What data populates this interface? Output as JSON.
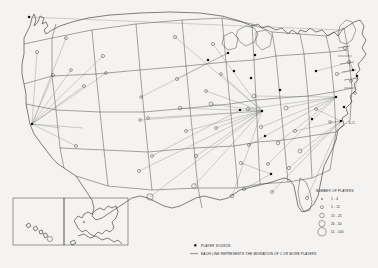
{
  "map": {
    "title": "Player Migration Map of the United States",
    "region_label": "United States",
    "annotations": [
      {
        "name": "dc-label",
        "text": "D.C.",
        "x": 347,
        "y": 122
      }
    ]
  },
  "size_legend": {
    "title": "NUMBER OF PLAYERS",
    "classes": [
      {
        "label": "1 - 4",
        "radius": 0.7
      },
      {
        "label": "5 - 12",
        "radius": 1.5
      },
      {
        "label": "13 - 25",
        "radius": 2.3
      },
      {
        "label": "26 - 50",
        "radius": 3.1
      },
      {
        "label": "51 - 100",
        "radius": 4.1
      }
    ]
  },
  "symbol_legend": {
    "items": [
      {
        "symbol": "filled-square",
        "label": "PLAYER SOURCE"
      },
      {
        "symbol": "line",
        "label": "EACH LINE REPRESENTS THE MIGRATION OF 1 OR MORE PLAYERS"
      }
    ]
  },
  "insets": [
    {
      "name": "hawaii",
      "label": ""
    },
    {
      "name": "alaska",
      "label": ""
    }
  ],
  "colors": {
    "background": "#f4f3f1",
    "outline": "#3b3b3b",
    "coast": "#2e2e2e",
    "flow_line": "#7d7d7d",
    "source_marker": "#111111",
    "text": "#222222"
  },
  "chart_data": {
    "type": "scatter",
    "xlabel": "",
    "ylabel": "",
    "size_classes": [
      "1 - 4",
      "5 - 12",
      "13 - 25",
      "26 - 50",
      "51 - 100"
    ],
    "bubbles": [
      {
        "x": 37,
        "y": 52,
        "r": 1.6,
        "class": "5 - 12"
      },
      {
        "x": 66,
        "y": 38,
        "r": 1.5,
        "class": "5 - 12"
      },
      {
        "x": 53,
        "y": 75,
        "r": 1.6,
        "class": "5 - 12"
      },
      {
        "x": 71,
        "y": 70,
        "r": 1.4,
        "class": "5 - 12"
      },
      {
        "x": 84,
        "y": 86,
        "r": 1.5,
        "class": "5 - 12"
      },
      {
        "x": 76,
        "y": 146,
        "r": 1.5,
        "class": "5 - 12"
      },
      {
        "x": 103,
        "y": 56,
        "r": 1.6,
        "class": "5 - 12"
      },
      {
        "x": 106,
        "y": 73,
        "r": 1.4,
        "class": "5 - 12"
      },
      {
        "x": 139,
        "y": 171,
        "r": 1.6,
        "class": "5 - 12"
      },
      {
        "x": 140,
        "y": 120,
        "r": 1.4,
        "class": "5 - 12"
      },
      {
        "x": 141,
        "y": 97,
        "r": 1.3,
        "class": "1 - 4"
      },
      {
        "x": 148,
        "y": 118,
        "r": 1.4,
        "class": "5 - 12"
      },
      {
        "x": 150,
        "y": 197,
        "r": 3.2,
        "class": "26 - 50"
      },
      {
        "x": 152,
        "y": 156,
        "r": 1.5,
        "class": "5 - 12"
      },
      {
        "x": 175,
        "y": 37,
        "r": 1.6,
        "class": "5 - 12"
      },
      {
        "x": 177,
        "y": 79,
        "r": 1.6,
        "class": "5 - 12"
      },
      {
        "x": 180,
        "y": 108,
        "r": 1.8,
        "class": "13 - 25"
      },
      {
        "x": 186,
        "y": 131,
        "r": 1.5,
        "class": "5 - 12"
      },
      {
        "x": 194,
        "y": 186,
        "r": 2.4,
        "class": "13 - 25"
      },
      {
        "x": 196,
        "y": 156,
        "r": 1.6,
        "class": "5 - 12"
      },
      {
        "x": 206,
        "y": 91,
        "r": 1.5,
        "class": "5 - 12"
      },
      {
        "x": 211,
        "y": 104,
        "r": 2.0,
        "class": "13 - 25"
      },
      {
        "x": 213,
        "y": 44,
        "r": 1.6,
        "class": "5 - 12"
      },
      {
        "x": 216,
        "y": 128,
        "r": 1.5,
        "class": "5 - 12"
      },
      {
        "x": 221,
        "y": 74,
        "r": 1.4,
        "class": "5 - 12"
      },
      {
        "x": 232,
        "y": 196,
        "r": 1.8,
        "class": "13 - 25"
      },
      {
        "x": 241,
        "y": 163,
        "r": 1.6,
        "class": "5 - 12"
      },
      {
        "x": 244,
        "y": 189,
        "r": 1.6,
        "class": "5 - 12"
      },
      {
        "x": 248,
        "y": 109,
        "r": 1.6,
        "class": "5 - 12"
      },
      {
        "x": 249,
        "y": 145,
        "r": 1.5,
        "class": "5 - 12"
      },
      {
        "x": 254,
        "y": 96,
        "r": 2.0,
        "class": "13 - 25"
      },
      {
        "x": 261,
        "y": 127,
        "r": 1.6,
        "class": "5 - 12"
      },
      {
        "x": 268,
        "y": 164,
        "r": 1.5,
        "class": "5 - 12"
      },
      {
        "x": 272,
        "y": 192,
        "r": 1.6,
        "class": "5 - 12"
      },
      {
        "x": 278,
        "y": 143,
        "r": 1.8,
        "class": "13 - 25"
      },
      {
        "x": 286,
        "y": 108,
        "r": 2.1,
        "class": "13 - 25"
      },
      {
        "x": 289,
        "y": 168,
        "r": 1.6,
        "class": "5 - 12"
      },
      {
        "x": 295,
        "y": 131,
        "r": 1.6,
        "class": "5 - 12"
      },
      {
        "x": 300,
        "y": 151,
        "r": 1.9,
        "class": "13 - 25"
      },
      {
        "x": 307,
        "y": 198,
        "r": 1.6,
        "class": "5 - 12"
      },
      {
        "x": 316,
        "y": 109,
        "r": 1.5,
        "class": "5 - 12"
      },
      {
        "x": 330,
        "y": 122,
        "r": 1.4,
        "class": "5 - 12"
      },
      {
        "x": 337,
        "y": 74,
        "r": 1.6,
        "class": "5 - 12"
      },
      {
        "x": 345,
        "y": 48,
        "r": 1.7,
        "class": "5 - 12"
      },
      {
        "x": 349,
        "y": 62,
        "r": 1.6,
        "class": "5 - 12"
      },
      {
        "x": 351,
        "y": 81,
        "r": 1.5,
        "class": "5 - 12"
      },
      {
        "x": 355,
        "y": 93,
        "r": 1.4,
        "class": "5 - 12"
      }
    ],
    "sources": [
      {
        "x": 29,
        "y": 17
      },
      {
        "x": 32,
        "y": 124
      },
      {
        "x": 208,
        "y": 60
      },
      {
        "x": 228,
        "y": 53
      },
      {
        "x": 234,
        "y": 71
      },
      {
        "x": 240,
        "y": 110
      },
      {
        "x": 251,
        "y": 78
      },
      {
        "x": 255,
        "y": 55
      },
      {
        "x": 262,
        "y": 111
      },
      {
        "x": 265,
        "y": 136
      },
      {
        "x": 271,
        "y": 174
      },
      {
        "x": 280,
        "y": 90
      },
      {
        "x": 312,
        "y": 119
      },
      {
        "x": 316,
        "y": 71
      },
      {
        "x": 336,
        "y": 97
      },
      {
        "x": 341,
        "y": 121
      },
      {
        "x": 344,
        "y": 107
      },
      {
        "x": 353,
        "y": 70
      },
      {
        "x": 357,
        "y": 76
      }
    ],
    "flows": [
      {
        "from": [
          37,
          52
        ],
        "to": [
          32,
          124
        ]
      },
      {
        "from": [
          66,
          38
        ],
        "to": [
          32,
          124
        ]
      },
      {
        "from": [
          53,
          75
        ],
        "to": [
          32,
          124
        ]
      },
      {
        "from": [
          71,
          70
        ],
        "to": [
          32,
          124
        ]
      },
      {
        "from": [
          84,
          86
        ],
        "to": [
          32,
          124
        ]
      },
      {
        "from": [
          103,
          56
        ],
        "to": [
          32,
          124
        ]
      },
      {
        "from": [
          106,
          73
        ],
        "to": [
          32,
          124
        ]
      },
      {
        "from": [
          76,
          146
        ],
        "to": [
          32,
          124
        ]
      },
      {
        "from": [
          60,
          128
        ],
        "to": [
          32,
          124
        ]
      },
      {
        "from": [
          83,
          128
        ],
        "to": [
          32,
          124
        ]
      },
      {
        "from": [
          29,
          17
        ],
        "to": [
          340,
          30
        ]
      },
      {
        "from": [
          175,
          37
        ],
        "to": [
          262,
          111
        ]
      },
      {
        "from": [
          213,
          44
        ],
        "to": [
          262,
          111
        ]
      },
      {
        "from": [
          206,
          91
        ],
        "to": [
          262,
          111
        ]
      },
      {
        "from": [
          196,
          156
        ],
        "to": [
          262,
          111
        ]
      },
      {
        "from": [
          211,
          104
        ],
        "to": [
          262,
          111
        ]
      },
      {
        "from": [
          186,
          131
        ],
        "to": [
          262,
          111
        ]
      },
      {
        "from": [
          180,
          108
        ],
        "to": [
          262,
          111
        ]
      },
      {
        "from": [
          148,
          118
        ],
        "to": [
          262,
          111
        ]
      },
      {
        "from": [
          140,
          120
        ],
        "to": [
          262,
          111
        ]
      },
      {
        "from": [
          150,
          197
        ],
        "to": [
          262,
          111
        ]
      },
      {
        "from": [
          139,
          171
        ],
        "to": [
          262,
          111
        ]
      },
      {
        "from": [
          216,
          128
        ],
        "to": [
          262,
          111
        ]
      },
      {
        "from": [
          194,
          186
        ],
        "to": [
          262,
          111
        ]
      },
      {
        "from": [
          232,
          196
        ],
        "to": [
          262,
          111
        ]
      },
      {
        "from": [
          221,
          74
        ],
        "to": [
          262,
          111
        ]
      },
      {
        "from": [
          254,
          96
        ],
        "to": [
          336,
          97
        ]
      },
      {
        "from": [
          248,
          109
        ],
        "to": [
          336,
          97
        ]
      },
      {
        "from": [
          261,
          127
        ],
        "to": [
          336,
          97
        ]
      },
      {
        "from": [
          249,
          145
        ],
        "to": [
          336,
          97
        ]
      },
      {
        "from": [
          268,
          164
        ],
        "to": [
          336,
          97
        ]
      },
      {
        "from": [
          278,
          143
        ],
        "to": [
          336,
          97
        ]
      },
      {
        "from": [
          286,
          108
        ],
        "to": [
          336,
          97
        ]
      },
      {
        "from": [
          272,
          192
        ],
        "to": [
          341,
          121
        ]
      },
      {
        "from": [
          289,
          168
        ],
        "to": [
          341,
          121
        ]
      },
      {
        "from": [
          300,
          151
        ],
        "to": [
          341,
          121
        ]
      },
      {
        "from": [
          307,
          198
        ],
        "to": [
          341,
          121
        ]
      },
      {
        "from": [
          295,
          131
        ],
        "to": [
          341,
          121
        ]
      },
      {
        "from": [
          316,
          109
        ],
        "to": [
          341,
          121
        ]
      },
      {
        "from": [
          330,
          122
        ],
        "to": [
          341,
          121
        ]
      },
      {
        "from": [
          345,
          48
        ],
        "to": [
          353,
          70
        ]
      },
      {
        "from": [
          337,
          74
        ],
        "to": [
          353,
          70
        ]
      },
      {
        "from": [
          349,
          62
        ],
        "to": [
          353,
          70
        ]
      },
      {
        "from": [
          351,
          81
        ],
        "to": [
          357,
          76
        ]
      },
      {
        "from": [
          355,
          93
        ],
        "to": [
          357,
          76
        ]
      },
      {
        "from": [
          244,
          189
        ],
        "to": [
          271,
          174
        ]
      },
      {
        "from": [
          241,
          163
        ],
        "to": [
          271,
          174
        ]
      },
      {
        "from": [
          177,
          79
        ],
        "to": [
          228,
          53
        ]
      },
      {
        "from": [
          141,
          97
        ],
        "to": [
          228,
          53
        ]
      },
      {
        "from": [
          152,
          156
        ],
        "to": [
          240,
          110
        ]
      },
      {
        "from": [
          347,
          63
        ],
        "to": [
          316,
          71
        ]
      }
    ]
  }
}
